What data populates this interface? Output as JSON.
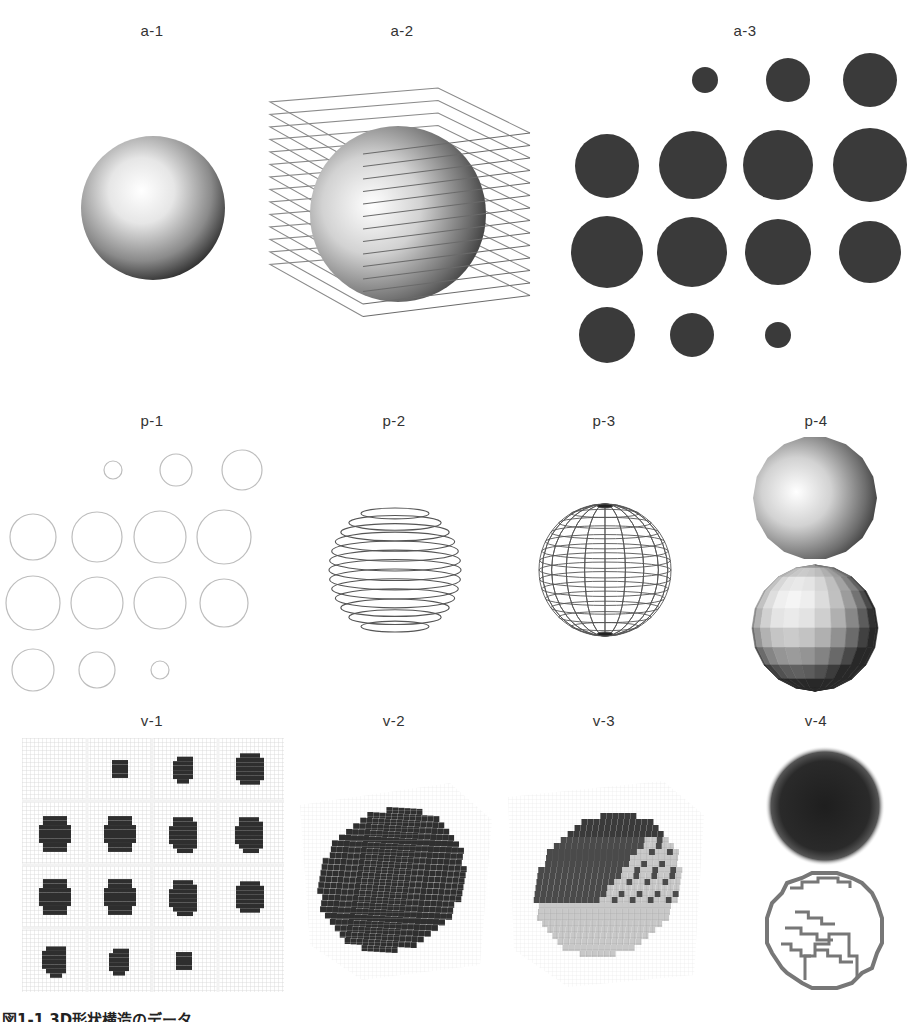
{
  "figure": {
    "rows": [
      {
        "row": "a",
        "panels": [
          {
            "id": "a-1",
            "label": "a-1",
            "description": "shaded-sphere"
          },
          {
            "id": "a-2",
            "label": "a-2",
            "description": "shaded-sphere-with-slice-planes"
          },
          {
            "id": "a-3",
            "label": "a-3",
            "description": "filled-cross-section-disks"
          }
        ]
      },
      {
        "row": "p",
        "panels": [
          {
            "id": "p-1",
            "label": "p-1",
            "description": "cross-section-contour-circles"
          },
          {
            "id": "p-2",
            "label": "p-2",
            "description": "stacked-contour-wireframe"
          },
          {
            "id": "p-3",
            "label": "p-3",
            "description": "lat-long-wireframe"
          },
          {
            "id": "p-4",
            "label": "p-4",
            "description": "smooth-and-faceted-polygon-spheres"
          }
        ]
      },
      {
        "row": "v",
        "panels": [
          {
            "id": "v-1",
            "label": "v-1",
            "description": "voxel-slice-grid"
          },
          {
            "id": "v-2",
            "label": "v-2",
            "description": "voxel-volume-dark"
          },
          {
            "id": "v-3",
            "label": "v-3",
            "description": "voxel-volume-stepped-surface"
          },
          {
            "id": "v-4",
            "label": "v-4",
            "description": "blurred-volume-and-voxel-outline"
          }
        ]
      }
    ],
    "caption": "図1-1 3D形状構造のデータ",
    "colors": {
      "disk_fill": "#3a3a3a",
      "contour_stroke": "#bdbdbd",
      "wire_stroke": "#555555",
      "grid_stroke": "#d8d8d8"
    }
  }
}
